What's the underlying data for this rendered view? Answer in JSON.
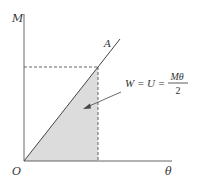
{
  "diagram": {
    "type": "moment-rotation work diagram",
    "axes": {
      "y_label": "M",
      "x_label": "θ",
      "origin_label": "O"
    },
    "line_label": "A",
    "equation": {
      "lhs": "W = U =",
      "numerator": "Mθ",
      "denominator": "2"
    },
    "colors": {
      "axis": "#555555",
      "line": "#444444",
      "shade": "#dcdcdc",
      "dash": "#555555",
      "text": "#333333"
    }
  }
}
